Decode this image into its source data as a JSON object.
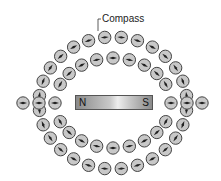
{
  "diagram": {
    "title_label": "Compass",
    "magnet": {
      "north_label": "N",
      "south_label": "S"
    },
    "colors": {
      "compass_fill": "#c8c8c8",
      "compass_stroke": "#444444",
      "needle": "#222222",
      "leader_line": "#333333"
    },
    "rings": [
      {
        "name": "outer",
        "cx": 113,
        "cy": 103,
        "rx": 74,
        "ry": 66,
        "count": 28
      },
      {
        "name": "inner",
        "cx": 113,
        "cy": 103,
        "rx": 58,
        "ry": 45,
        "count": 22
      }
    ],
    "axis_row": {
      "y": 103,
      "left_x": [
        23
      ],
      "right_x": [
        202
      ]
    }
  }
}
